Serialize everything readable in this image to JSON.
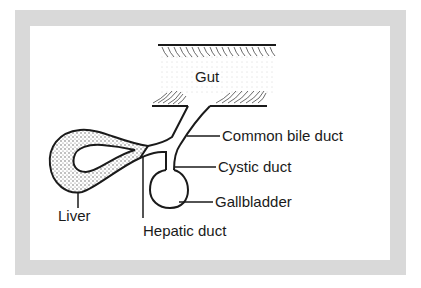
{
  "diagram": {
    "labels": {
      "gut": "Gut",
      "common_bile_duct": "Common bile duct",
      "cystic_duct": "Cystic duct",
      "gallbladder": "Gallbladder",
      "liver": "Liver",
      "hepatic_duct": "Hepatic duct"
    },
    "colors": {
      "frame": "#d9d9d9",
      "ink": "#1a1a1a",
      "background": "#ffffff"
    }
  }
}
